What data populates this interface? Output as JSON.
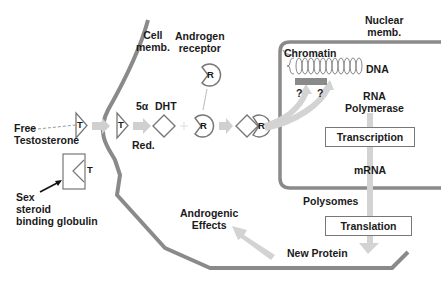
{
  "labels": {
    "cell_membrane": [
      "Cell",
      "memb."
    ],
    "androgen_receptor": [
      "Androgen",
      "receptor"
    ],
    "nuclear_membrane": [
      "Nuclear",
      "memb."
    ],
    "chromatin": "Chromatin",
    "dna": "DNA",
    "question_1": "?",
    "question_2": "?",
    "rna_polymerase": [
      "RNA",
      "Polymerase"
    ],
    "transcription": "Transcription",
    "mrna": "mRNA",
    "polysomes": "Polysomes",
    "translation": "Translation",
    "new_protein": "New Protein",
    "androgenic_effects": [
      "Androgenic",
      "Effects"
    ],
    "free_testosterone": [
      "Free",
      "Testosterone"
    ],
    "five_alpha": "5α",
    "reductase": "Red.",
    "dht": "DHT",
    "shbg": [
      "Sex",
      "steroid",
      "binding globulin"
    ],
    "t_symbol": "T",
    "r_symbol": "R"
  },
  "colors": {
    "membrane": "#8a8a8a",
    "arrow": "#cfcfcf",
    "outline": "#777777",
    "text": "#1a1a1a",
    "chromatin_bar": "#8a8a8a"
  }
}
